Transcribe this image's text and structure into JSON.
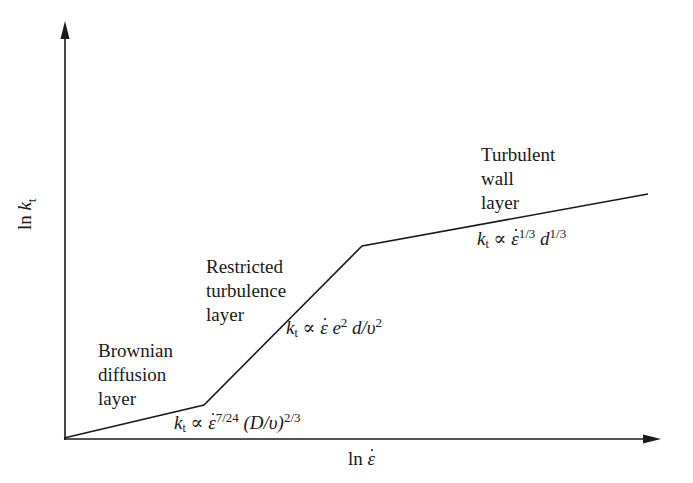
{
  "diagram": {
    "type": "piecewise-log-log schematic",
    "x_axis": {
      "label_prefix": "ln",
      "label_var": "ε",
      "label_full": "ln ε̇"
    },
    "y_axis": {
      "label_prefix": "ln",
      "label_var": "k",
      "label_sub": "t",
      "label_full": "ln k_t"
    },
    "segments": [
      {
        "name": "Brownian diffusion layer",
        "label_lines": [
          "Brownian",
          "diffusion",
          "layer"
        ],
        "relation": {
          "lhs_var": "k",
          "lhs_sub": "t",
          "prop": "∝",
          "eps": "ε",
          "eps_exp": "7/24",
          "rest": "(D/υ)",
          "rest_exp": "2/3",
          "full": "k_t ∝ ε̇^(7/24) (D/υ)^(2/3)"
        }
      },
      {
        "name": "Restricted turbulence layer",
        "label_lines": [
          "Restricted",
          "turbulence",
          "layer"
        ],
        "relation": {
          "lhs_var": "k",
          "lhs_sub": "t",
          "prop": "∝",
          "eps": "ε",
          "e_var": "e",
          "e_exp": "2",
          "rest": "d/υ",
          "rest_exp": "2",
          "full": "k_t ∝ ε̇ e^2 d/υ^2"
        }
      },
      {
        "name": "Turbulent wall layer",
        "label_lines": [
          "Turbulent",
          "wall",
          "layer"
        ],
        "relation": {
          "lhs_var": "k",
          "lhs_sub": "t",
          "prop": "∝",
          "eps": "ε",
          "eps_exp": "1/3",
          "rest": "d",
          "rest_exp": "1/3",
          "full": "k_t ∝ ε̇^(1/3) d^(1/3)"
        }
      }
    ],
    "polyline_points": [
      [
        64,
        438
      ],
      [
        204,
        405
      ],
      [
        362,
        246
      ],
      [
        648,
        194
      ]
    ],
    "colors": {
      "line": "#1a1a1a",
      "background": "#ffffff"
    }
  }
}
